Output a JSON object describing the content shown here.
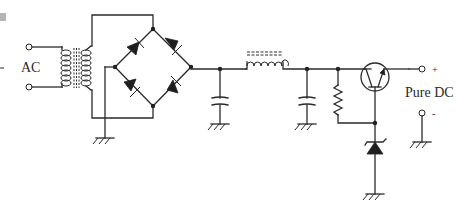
{
  "diagram": {
    "labels": {
      "input": "AC",
      "output": "Pure DC",
      "positive": "+",
      "negative": "-"
    },
    "components": [
      {
        "id": "transformer",
        "type": "transformer",
        "description": "Step-down transformer with iron core"
      },
      {
        "id": "bridge-rectifier",
        "type": "diode-bridge",
        "diodes": 4
      },
      {
        "id": "filter-capacitor-1",
        "type": "capacitor"
      },
      {
        "id": "choke-inductor",
        "type": "inductor",
        "core": "iron"
      },
      {
        "id": "filter-capacitor-2",
        "type": "capacitor"
      },
      {
        "id": "bias-resistor",
        "type": "resistor"
      },
      {
        "id": "pass-transistor",
        "type": "npn-transistor"
      },
      {
        "id": "zener-diode",
        "type": "zener-diode"
      },
      {
        "id": "grounds",
        "type": "ground",
        "count": 6
      }
    ],
    "colors": {
      "line": "#2a2a2a",
      "background": "#ffffff",
      "edge_block": "#b5b5b5"
    }
  }
}
